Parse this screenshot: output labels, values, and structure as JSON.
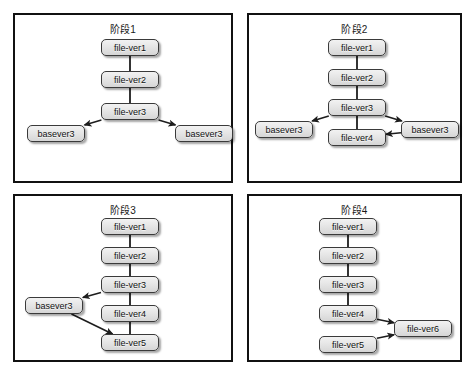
{
  "figure": {
    "background_color": "#ffffff",
    "panel_border_color": "#111111",
    "node_fill_color": "#e6e6e6",
    "node_border_color": "#3a3a3a",
    "arrow_color": "#1d1d1d"
  },
  "panels": [
    {
      "id": "panel-1",
      "title": "阶段1",
      "nodes": [
        {
          "id": "p1-fv1",
          "label": "file-ver1",
          "x": 86,
          "y": 24,
          "w": 58,
          "h": 17
        },
        {
          "id": "p1-fv2",
          "label": "file-ver2",
          "x": 86,
          "y": 56,
          "w": 58,
          "h": 17
        },
        {
          "id": "p1-fv3",
          "label": "file-ver3",
          "x": 86,
          "y": 88,
          "w": 58,
          "h": 17
        },
        {
          "id": "p1-bl",
          "label": "basever3",
          "x": 12,
          "y": 110,
          "w": 58,
          "h": 17
        },
        {
          "id": "p1-br",
          "label": "basever3",
          "x": 160,
          "y": 110,
          "w": 58,
          "h": 17
        }
      ],
      "edges": [
        {
          "from": "p1-fv1",
          "to": "p1-fv2",
          "type": "plain"
        },
        {
          "from": "p1-fv2",
          "to": "p1-fv3",
          "type": "plain"
        },
        {
          "from": "p1-fv3",
          "to": "p1-bl",
          "type": "arrow"
        },
        {
          "from": "p1-fv3",
          "to": "p1-br",
          "type": "arrow"
        }
      ]
    },
    {
      "id": "panel-2",
      "title": "阶段2",
      "nodes": [
        {
          "id": "p2-fv1",
          "label": "file-ver1",
          "x": 79,
          "y": 24,
          "w": 58,
          "h": 17
        },
        {
          "id": "p2-fv2",
          "label": "file-ver2",
          "x": 79,
          "y": 54,
          "w": 58,
          "h": 17
        },
        {
          "id": "p2-fv3",
          "label": "file-ver3",
          "x": 79,
          "y": 84,
          "w": 58,
          "h": 17
        },
        {
          "id": "p2-fv4",
          "label": "file-ver4",
          "x": 79,
          "y": 114,
          "w": 58,
          "h": 17
        },
        {
          "id": "p2-bl",
          "label": "basever3",
          "x": 6,
          "y": 106,
          "w": 58,
          "h": 17
        },
        {
          "id": "p2-br",
          "label": "basever3",
          "x": 152,
          "y": 106,
          "w": 58,
          "h": 17
        }
      ],
      "edges": [
        {
          "from": "p2-fv1",
          "to": "p2-fv2",
          "type": "plain"
        },
        {
          "from": "p2-fv2",
          "to": "p2-fv3",
          "type": "plain"
        },
        {
          "from": "p2-fv3",
          "to": "p2-fv4",
          "type": "plain"
        },
        {
          "from": "p2-fv3",
          "to": "p2-bl",
          "type": "arrow"
        },
        {
          "from": "p2-fv3",
          "to": "p2-br",
          "type": "arrow"
        },
        {
          "from": "p2-br",
          "to": "p2-fv4",
          "type": "arrow"
        }
      ]
    },
    {
      "id": "panel-3",
      "title": "阶段3",
      "nodes": [
        {
          "id": "p3-fv1",
          "label": "file-ver1",
          "x": 86,
          "y": 22,
          "w": 58,
          "h": 17
        },
        {
          "id": "p3-fv2",
          "label": "file-ver2",
          "x": 86,
          "y": 51,
          "w": 58,
          "h": 17
        },
        {
          "id": "p3-fv3",
          "label": "file-ver3",
          "x": 86,
          "y": 80,
          "w": 58,
          "h": 17
        },
        {
          "id": "p3-fv4",
          "label": "file-ver4",
          "x": 86,
          "y": 109,
          "w": 58,
          "h": 17
        },
        {
          "id": "p3-fv5",
          "label": "file-ver5",
          "x": 86,
          "y": 138,
          "w": 58,
          "h": 17
        },
        {
          "id": "p3-base",
          "label": "basever3",
          "x": 10,
          "y": 101,
          "w": 58,
          "h": 17
        }
      ],
      "edges": [
        {
          "from": "p3-fv1",
          "to": "p3-fv2",
          "type": "plain"
        },
        {
          "from": "p3-fv2",
          "to": "p3-fv3",
          "type": "plain"
        },
        {
          "from": "p3-fv3",
          "to": "p3-fv4",
          "type": "plain"
        },
        {
          "from": "p3-fv4",
          "to": "p3-fv5",
          "type": "plain"
        },
        {
          "from": "p3-fv3",
          "to": "p3-base",
          "type": "arrow"
        },
        {
          "from": "p3-base",
          "to": "p3-fv5",
          "type": "arrow"
        }
      ]
    },
    {
      "id": "panel-4",
      "title": "阶段4",
      "nodes": [
        {
          "id": "p4-fv1",
          "label": "file-ver1",
          "x": 70,
          "y": 22,
          "w": 58,
          "h": 17
        },
        {
          "id": "p4-fv2",
          "label": "file-ver2",
          "x": 70,
          "y": 51,
          "w": 58,
          "h": 17
        },
        {
          "id": "p4-fv3",
          "label": "file-ver3",
          "x": 70,
          "y": 80,
          "w": 58,
          "h": 17
        },
        {
          "id": "p4-fv4",
          "label": "file-ver4",
          "x": 70,
          "y": 109,
          "w": 58,
          "h": 17
        },
        {
          "id": "p4-fv5",
          "label": "file-ver5",
          "x": 70,
          "y": 140,
          "w": 58,
          "h": 17
        },
        {
          "id": "p4-fv6",
          "label": "file-ver6",
          "x": 145,
          "y": 124,
          "w": 58,
          "h": 17
        }
      ],
      "edges": [
        {
          "from": "p4-fv1",
          "to": "p4-fv2",
          "type": "plain"
        },
        {
          "from": "p4-fv2",
          "to": "p4-fv3",
          "type": "plain"
        },
        {
          "from": "p4-fv3",
          "to": "p4-fv4",
          "type": "plain"
        },
        {
          "from": "p4-fv4",
          "to": "p4-fv6",
          "type": "arrow"
        },
        {
          "from": "p4-fv5",
          "to": "p4-fv6",
          "type": "arrow"
        }
      ]
    }
  ]
}
